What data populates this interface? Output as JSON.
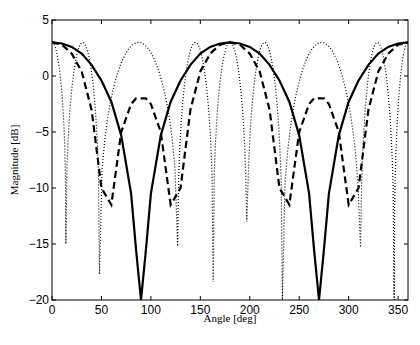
{
  "chart_data": {
    "type": "line",
    "title": "",
    "xlabel": "Angle [deg]",
    "ylabel": "Magnitude [dB]",
    "xlim": [
      0,
      360
    ],
    "ylim": [
      -20,
      5
    ],
    "xticks": [
      0,
      50,
      100,
      150,
      200,
      250,
      300,
      350
    ],
    "yticks": [
      5,
      0,
      -5,
      -10,
      -15,
      -20
    ],
    "grid": false,
    "legend": null,
    "x": [
      0,
      10,
      20,
      30,
      40,
      50,
      60,
      70,
      80,
      85,
      90,
      95,
      100,
      110,
      120,
      130,
      140,
      150,
      160,
      170,
      180,
      190,
      200,
      210,
      220,
      230,
      240,
      250,
      260,
      265,
      270,
      275,
      280,
      290,
      300,
      310,
      320,
      330,
      340,
      350,
      360
    ],
    "series": [
      {
        "name": "solid",
        "style": "solid",
        "width": 2.2,
        "values": [
          3.0,
          2.9,
          2.6,
          2.0,
          1.0,
          -0.4,
          -2.3,
          -5.3,
          -10.5,
          -15.5,
          -20,
          -15.5,
          -10.5,
          -5.3,
          -2.3,
          -0.4,
          1.0,
          2.0,
          2.6,
          2.9,
          3.0,
          2.9,
          2.6,
          2.0,
          1.0,
          -0.4,
          -2.3,
          -5.3,
          -10.5,
          -15.5,
          -20,
          -15.5,
          -10.5,
          -5.3,
          -2.3,
          -0.4,
          1.0,
          2.0,
          2.6,
          2.9,
          3.0
        ]
      },
      {
        "name": "dashed",
        "style": "dashed",
        "width": 2.2,
        "values": [
          3.0,
          2.8,
          2.0,
          0.4,
          -3.0,
          -10.0,
          -11.5,
          -5.0,
          -2.5,
          -2.0,
          -2.0,
          -2.0,
          -2.5,
          -5.0,
          -11.5,
          -10.0,
          -3.0,
          0.4,
          2.0,
          2.8,
          3.0,
          2.8,
          2.0,
          0.4,
          -3.0,
          -10.0,
          -11.5,
          -5.0,
          -2.5,
          -2.0,
          -2.0,
          -2.0,
          -2.5,
          -5.0,
          -11.5,
          -10.0,
          -3.0,
          0.4,
          2.0,
          2.8,
          3.0
        ]
      },
      {
        "name": "dotted",
        "style": "dotted",
        "width": 1.2,
        "nulls_deg": [
          14,
          48,
          127,
          163,
          197,
          233,
          312,
          346
        ],
        "null_depths_db": [
          -15,
          -17.7,
          -15.2,
          -18.4,
          -13,
          -20,
          -15.3,
          -20
        ],
        "peak_db": 3.0
      }
    ]
  }
}
